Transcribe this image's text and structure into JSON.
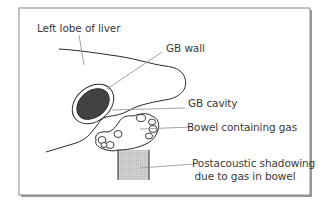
{
  "diagram": {
    "labels": {
      "left_lobe": "Left lobe of liver",
      "gb_wall": "GB wall",
      "gb_cavity": "GB cavity",
      "bowel_gas": "Bowel containing gas",
      "shadowing_line1": "Postacoustic shadowing",
      "shadowing_line2": "due to gas in bowel"
    },
    "colors": {
      "frame": "#8a8a8a",
      "outline": "#2a2a2a",
      "gb_cavity_fill": "#3d3d3d",
      "shadow_fill": "#cfcfcf",
      "leader_line": "#8c8c8c",
      "text": "#3a3a3a"
    }
  }
}
